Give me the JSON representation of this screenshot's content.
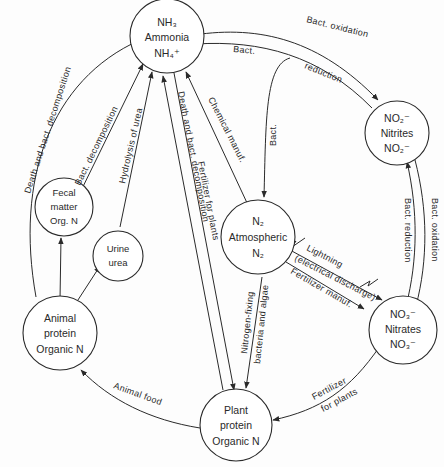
{
  "diagram": {
    "nodes": {
      "ammonia": {
        "line1": "NH₃",
        "line2": "Ammonia",
        "line3": "NH₄⁺"
      },
      "nitrites": {
        "line1": "NO₂⁻",
        "line2": "Nitrites",
        "line3": "NO₂⁻"
      },
      "atmospheric": {
        "line1": "N₂",
        "line2": "Atmospheric",
        "line3": "N₂"
      },
      "nitrates": {
        "line1": "NO₃⁻",
        "line2": "Nitrates",
        "line3": "NO₃⁻"
      },
      "fecal": {
        "line1": "Fecal",
        "line2": "matter",
        "line3": "Org. N"
      },
      "urine": {
        "line1": "Urine",
        "line2": "urea"
      },
      "animal": {
        "line1": "Animal",
        "line2": "protein",
        "line3": "Organic N"
      },
      "plant": {
        "line1": "Plant",
        "line2": "protein",
        "line3": "Organic N"
      }
    },
    "edges": {
      "bact_oxidation_top": "Bact. oxidation",
      "bact_reduction_top_a": "Bact.",
      "bact_reduction_top_b": "reduction",
      "bact_n2": "Bact.",
      "chemical_manuf": "Chemical manuf.",
      "bact_oxidation_right": "Bact. oxidation",
      "bact_reduction_right": "Bact. reduction",
      "lightning": "Lightning",
      "electrical_discharge": "(electrical discharge)",
      "fertilizer_manuf": "Fertilizer manuf.",
      "fertilizer_for_plants_bottom_a": "Fertilizer",
      "fertilizer_for_plants_bottom_b": "for plants",
      "nitrogen_fixing_a": "Nitrogen-fixing",
      "nitrogen_fixing_b": "bacteria and algae",
      "fertilizer_for_plants_center": "Fertilizer for plants",
      "death_decomp_center": "Death and bact. decomposition",
      "animal_food": "Animal food",
      "death_decomp_left": "Death and bact. decomposition",
      "bact_decomposition": "Bact. decomposition",
      "hydrolysis_urea": "Hydrolysis of urea"
    }
  }
}
